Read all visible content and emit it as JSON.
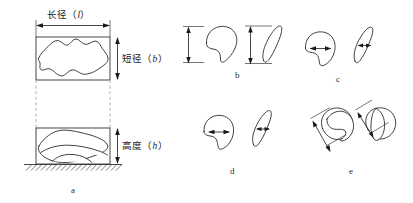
{
  "figure": {
    "background_color": "#ffffff",
    "line_color": "#2b2b2b",
    "dash_color": "#a9a9a9",
    "dimension_color": "#1a1a1a"
  },
  "panel_a": {
    "letter": "a",
    "labels": {
      "major_diameter": "长径（",
      "major_diameter_symbol": "l",
      "major_diameter_close": "）",
      "minor_diameter": "短径（",
      "minor_diameter_symbol": "b",
      "minor_diameter_close": "）",
      "height": "高度（",
      "height_symbol": "h",
      "height_close": "）"
    },
    "views": [
      {
        "name": "plan-view",
        "description": "top projection in bounding box"
      },
      {
        "name": "elevation-view",
        "description": "side projection resting on ground"
      }
    ]
  },
  "panel_b": {
    "letter": "b",
    "dimension": "vertical",
    "shapes": [
      "kidney-shape-upright",
      "slender-blade-shape"
    ]
  },
  "panel_c": {
    "letter": "c",
    "dimension": "horizontal-internal",
    "shapes": [
      "kidney-shape-upright",
      "slender-blade-shape"
    ]
  },
  "panel_d": {
    "letter": "d",
    "dimension": "horizontal-internal",
    "shapes": [
      "kidney-shape-upright",
      "slender-blade-shape"
    ]
  },
  "panel_e": {
    "letter": "e",
    "dimension": "diagonal-external",
    "shapes": [
      "rounded-lobed-shape",
      "rounded-lobed-shape-rotated"
    ]
  }
}
